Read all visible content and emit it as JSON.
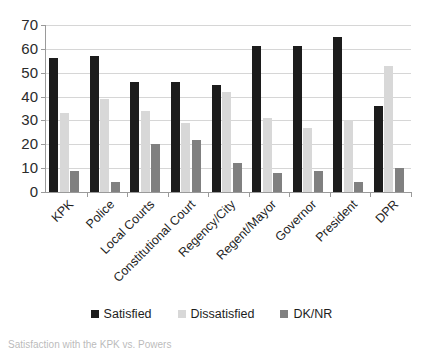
{
  "chart_data": {
    "type": "bar",
    "title": "",
    "subtitle": "",
    "xlabel": "",
    "ylabel": "",
    "ylim": [
      0,
      70
    ],
    "ytick_step": 10,
    "yticks": [
      0,
      10,
      20,
      30,
      40,
      50,
      60,
      70
    ],
    "grid": "horizontal",
    "legend_position": "bottom",
    "categories": [
      "KPK",
      "Police",
      "Local Courts",
      "Constitutional Court",
      "Regency/City",
      "Regent/Mayor",
      "Governor",
      "President",
      "DPR"
    ],
    "series": [
      {
        "name": "Satisfied",
        "color": "#1c1c1c",
        "values": [
          56,
          57,
          46,
          46,
          45,
          61,
          61,
          65,
          36
        ]
      },
      {
        "name": "Dissatisfied",
        "color": "#d8d8d8",
        "values": [
          33,
          39,
          34,
          29,
          42,
          31,
          27,
          30,
          53
        ]
      },
      {
        "name": "DK/NR",
        "color": "#808080",
        "values": [
          9,
          4,
          20,
          22,
          12,
          8,
          9,
          4,
          10
        ]
      }
    ]
  },
  "legend": {
    "items": [
      {
        "label": "Satisfied",
        "color": "#1c1c1c",
        "swatch_name": "legend-swatch-satisfied"
      },
      {
        "label": "Dissatisfied",
        "color": "#d8d8d8",
        "swatch_name": "legend-swatch-dissatisfied"
      },
      {
        "label": "DK/NR",
        "color": "#808080",
        "swatch_name": "legend-swatch-dknr"
      }
    ]
  },
  "caption": {
    "text": "Satisfaction with the KPK vs. Powers"
  }
}
